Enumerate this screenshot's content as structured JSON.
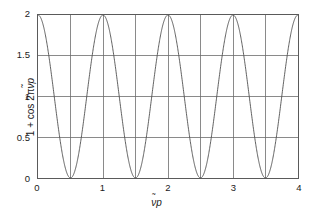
{
  "chart_data": {
    "type": "line",
    "title": "",
    "xlabel": "ᵽ̃p",
    "ylabel": "1 + cos 2πᵽ̃p",
    "xlim": [
      0,
      4
    ],
    "ylim": [
      0,
      2
    ],
    "xticks": [
      0,
      1,
      2,
      3,
      4
    ],
    "xticklabels": [
      "0",
      "1",
      "2",
      "3",
      "4"
    ],
    "yticks": [
      0,
      0.5,
      1,
      1.5,
      2
    ],
    "yticklabels": [
      "0",
      "0.5",
      "1",
      "1.5",
      "2"
    ],
    "grid": true,
    "grid_x_step": 0.5,
    "grid_y_step": 0.5,
    "legend": "none",
    "series": [
      {
        "name": "1 + cos 2πᵽ̃p",
        "formula": "y = 1 + cos(2*pi*x)",
        "period": 1,
        "amplitude": 1,
        "offset": 1,
        "color": "#4d4d4d",
        "linewidth": 0.9,
        "maxima_x": [
          0,
          1,
          2,
          3,
          4
        ],
        "maxima_y": [
          2,
          2,
          2,
          2,
          2
        ],
        "minima_x": [
          0.5,
          1.5,
          2.5,
          3.5
        ],
        "minima_y": [
          0,
          0,
          0,
          0
        ],
        "x": [
          0,
          0.1,
          0.2,
          0.3,
          0.4,
          0.5,
          0.6,
          0.7,
          0.8,
          0.9,
          1,
          1.1,
          1.2,
          1.3,
          1.4,
          1.5,
          1.6,
          1.7,
          1.8,
          1.9,
          2,
          2.1,
          2.2,
          2.3,
          2.4,
          2.5,
          2.6,
          2.7,
          2.8,
          2.9,
          3,
          3.1,
          3.2,
          3.3,
          3.4,
          3.5,
          3.6,
          3.7,
          3.8,
          3.9,
          4
        ],
        "y": [
          2,
          1.809,
          1.309,
          0.691,
          0.191,
          0,
          0.191,
          0.691,
          1.309,
          1.809,
          2,
          1.809,
          1.309,
          0.691,
          0.191,
          0,
          0.191,
          0.691,
          1.309,
          1.809,
          2,
          1.809,
          1.309,
          0.691,
          0.191,
          0,
          0.191,
          0.691,
          1.309,
          1.809,
          2,
          1.809,
          1.309,
          0.691,
          0.191,
          0,
          0.191,
          0.691,
          1.309,
          1.809,
          2
        ]
      }
    ]
  },
  "style": {
    "background": "#ffffff",
    "frame_color": "#5a5a5a",
    "grid_color": "#6b6b6b",
    "curve_color": "#4d4d4d",
    "text_color": "#1a1a1a"
  },
  "labels": {
    "y0": "0",
    "y1": "0.5",
    "y2": "1",
    "y3": "1.5",
    "y4": "2",
    "x0": "0",
    "x1": "1",
    "x2": "2",
    "x3": "3",
    "x4": "4"
  }
}
